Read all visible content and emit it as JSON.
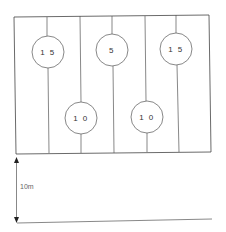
{
  "diagram": {
    "frame": {
      "x1": 14,
      "y1": 16,
      "x2": 210,
      "y2": 153,
      "stroke": "#444444"
    },
    "dividers": [
      {
        "name": "divider-1",
        "x_top": 14,
        "x_bot": 16
      },
      {
        "name": "divider-3",
        "x_top": 80,
        "x_bot": 82
      },
      {
        "name": "divider-5",
        "x_top": 145,
        "x_bot": 147
      },
      {
        "name": "divider-end",
        "x_top": 210,
        "x_bot": 211
      }
    ],
    "circles": [
      {
        "label": "1 5",
        "cx": 48,
        "cy": 52,
        "r": 16
      },
      {
        "label": "5",
        "cx": 112,
        "cy": 50,
        "r": 16
      },
      {
        "label": "1 5",
        "cx": 176,
        "cy": 49,
        "r": 16
      },
      {
        "label": "1 0",
        "cx": 81,
        "cy": 118,
        "r": 16
      },
      {
        "label": "1 0",
        "cx": 147,
        "cy": 117,
        "r": 16
      }
    ],
    "dimension": {
      "label": "10m",
      "x": 16,
      "y_top": 159,
      "y_bottom": 221
    },
    "ground_line": {
      "x1": 17,
      "y1": 223,
      "x2": 212,
      "y2": 220
    }
  }
}
